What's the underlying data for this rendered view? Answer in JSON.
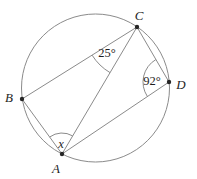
{
  "figure": {
    "type": "circle-geometry-diagram",
    "background": "#ffffff",
    "line_color": "#8b8b8b",
    "text_color": "#1e1e1e",
    "dot_color": "#262626",
    "circle": {
      "cx": 95.5,
      "cy": 88,
      "r": 74
    },
    "points": {
      "A": {
        "x": 62,
        "y": 154,
        "label": "A",
        "label_x": 56,
        "label_y": 168
      },
      "B": {
        "x": 22,
        "y": 99,
        "label": "B",
        "label_x": 9,
        "label_y": 97
      },
      "C": {
        "x": 137,
        "y": 27,
        "label": "C",
        "label_x": 139,
        "label_y": 15
      },
      "D": {
        "x": 169,
        "y": 82,
        "label": "D",
        "label_x": 181,
        "label_y": 84
      }
    },
    "chords": [
      [
        "B",
        "C"
      ],
      [
        "B",
        "A"
      ],
      [
        "A",
        "C"
      ],
      [
        "C",
        "D"
      ],
      [
        "A",
        "D"
      ]
    ],
    "angle_marks": [
      {
        "at": "C",
        "from": "B",
        "to": "A",
        "radius": 53,
        "label": "25°",
        "label_x": 107,
        "label_y": 53,
        "italic": false
      },
      {
        "at": "D",
        "from": "C",
        "to": "A",
        "radius": 26,
        "label": "92°",
        "label_x": 152,
        "label_y": 81,
        "italic": false
      },
      {
        "at": "A",
        "from": "B",
        "to": "C",
        "radius": 21,
        "label": "x",
        "label_x": 61,
        "label_y": 144,
        "italic": true
      }
    ]
  }
}
